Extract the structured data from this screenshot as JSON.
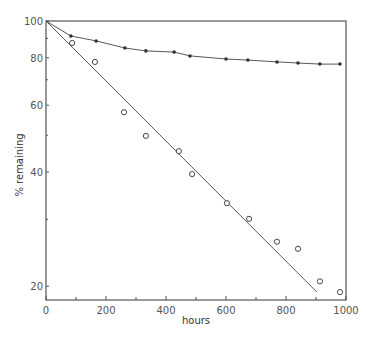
{
  "chart_data": {
    "type": "line",
    "title": "",
    "xlabel": "hours",
    "ylabel": "% remaining",
    "xlim": [
      0,
      1000
    ],
    "ylim": [
      18,
      100
    ],
    "yscale": "log",
    "grid": false,
    "legend": null,
    "x_ticks": [
      0,
      200,
      400,
      600,
      800,
      1000
    ],
    "x_minor_ticks": [
      100,
      300,
      500,
      700,
      900
    ],
    "y_ticks": [
      100,
      80,
      60,
      40,
      20
    ],
    "series": [
      {
        "name": "filled circles",
        "marker": "filled-circle",
        "line": "smooth curve through points",
        "x": [
          0,
          83,
          167,
          263,
          333,
          427,
          480,
          600,
          673,
          770,
          840,
          913,
          980
        ],
        "y": [
          100,
          91.3,
          88.6,
          84.9,
          83.4,
          82.8,
          80.9,
          79.4,
          78.9,
          78.0,
          77.5,
          77.0,
          77.0
        ]
      },
      {
        "name": "open circles",
        "marker": "open-circle",
        "line": "straight fitted line from (0,100) to (903,19.3)",
        "x": [
          87,
          163,
          260,
          333,
          443,
          487,
          603,
          677,
          770,
          840,
          913,
          980
        ],
        "y": [
          87.5,
          78.0,
          57.5,
          49.8,
          45.4,
          39.5,
          33.1,
          30.1,
          26.2,
          25.1,
          20.6,
          19.3
        ],
        "fit_line": {
          "x": [
            0,
            903
          ],
          "y": [
            100,
            19.3
          ]
        }
      }
    ]
  },
  "labels": {
    "x_axis_title": "hours",
    "y_axis_title": "% remaining",
    "x_tick_labels": [
      "0",
      "200",
      "400",
      "600",
      "800",
      "1000"
    ],
    "y_tick_labels": [
      "100",
      "80",
      "60",
      "40",
      "20"
    ]
  },
  "colors": {
    "axis": "#555555",
    "line": "#444444",
    "marker": "#333333",
    "text": "#555555"
  }
}
